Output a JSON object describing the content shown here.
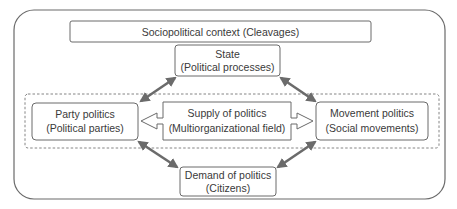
{
  "diagram": {
    "context": {
      "label": "Sociopolitical context (Cleavages)"
    },
    "state": {
      "line1": "State",
      "line2": "(Political processes)"
    },
    "party": {
      "line1": "Party politics",
      "line2": "(Political parties)"
    },
    "supply": {
      "line1": "Supply of politics",
      "line2": "(Multiorganizational field)"
    },
    "movement": {
      "line1": "Movement politics",
      "line2": "(Social movements)"
    },
    "demand": {
      "line1": "Demand of politics",
      "line2": "(Citizens)"
    },
    "colors": {
      "stroke": "#6a6a6a",
      "arrow": "#6b6b6b",
      "text": "#3a3a3a",
      "background": "#ffffff"
    }
  }
}
